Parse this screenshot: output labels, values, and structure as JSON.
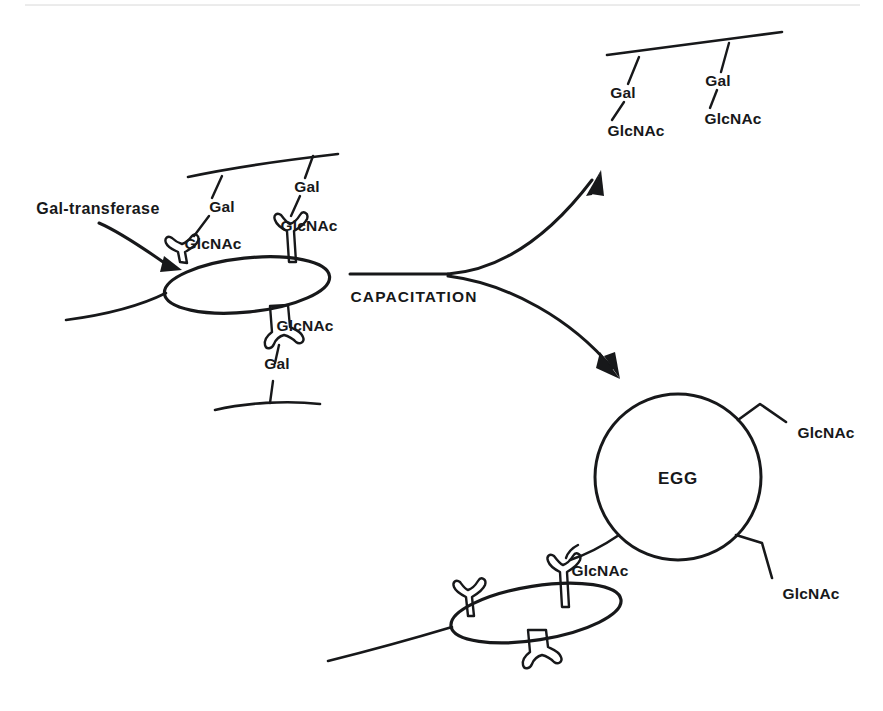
{
  "figure": {
    "background_color": "#ffffff",
    "ink_color": "#17181a",
    "width": 883,
    "height": 711
  },
  "labels": {
    "enzyme": "Gal-transferase",
    "process": "CAPACITATION",
    "egg": "EGG",
    "gal": "Gal",
    "glcnac": "GlcNAc"
  },
  "uncapacitated_sperm": {
    "name": "uncapacitated-sperm",
    "enzyme_label": "Gal-transferase",
    "oviduct_sugars": [
      {
        "id": "chain-upper-left",
        "gal": "Gal",
        "glcnac": "GlcNAc"
      },
      {
        "id": "chain-upper-right",
        "gal": "Gal",
        "glcnac": "GlcNAc"
      },
      {
        "id": "chain-lower",
        "gal": "Gal",
        "glcnac": "GlcNAc"
      }
    ]
  },
  "oviduct_epithelium": {
    "name": "oviduct-epithelium-released",
    "chains": [
      {
        "id": "released-left",
        "gal": "Gal",
        "glcnac": "GlcNAc"
      },
      {
        "id": "released-right",
        "gal": "Gal",
        "glcnac": "GlcNAc"
      }
    ]
  },
  "egg": {
    "name": "egg-cell",
    "label": "EGG",
    "ligands": [
      {
        "id": "egg-ligand-upper-right",
        "label": "GlcNAc"
      },
      {
        "id": "egg-ligand-lower-right",
        "label": "GlcNAc"
      },
      {
        "id": "egg-ligand-lower-left",
        "label": "GlcNAc"
      }
    ]
  },
  "capacitated_sperm": {
    "name": "capacitated-sperm",
    "bound_ligand": "GlcNAc"
  },
  "arrows": [
    {
      "id": "capacitation-arrow-up",
      "label": "CAPACITATION"
    },
    {
      "id": "capacitation-arrow-down",
      "label": "CAPACITATION"
    },
    {
      "id": "enzyme-pointer-arrow",
      "label": "Gal-transferase"
    }
  ]
}
